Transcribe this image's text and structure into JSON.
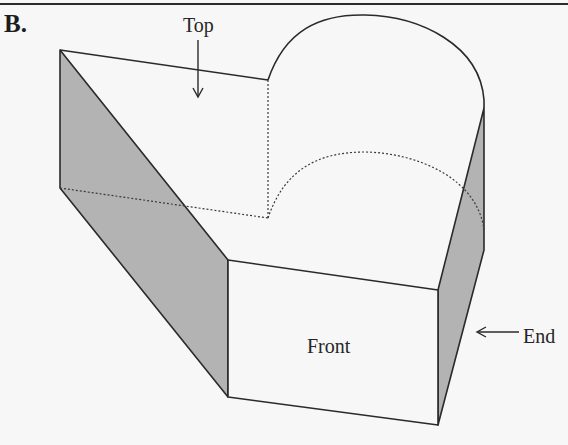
{
  "figure": {
    "panel_label": "B.",
    "labels": {
      "top": "Top",
      "front": "Front",
      "end": "End"
    },
    "colors": {
      "background": "#f7f7f7",
      "line": "#2a2a2a",
      "shade": "#b3b3b3",
      "dotted": "#3a3a3a"
    }
  }
}
